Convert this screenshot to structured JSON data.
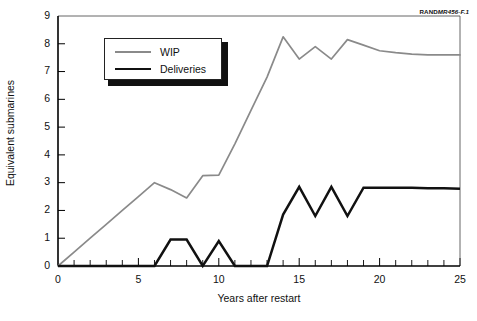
{
  "source_credit": {
    "prefix": "RAND",
    "suffix": "MR456-F.1"
  },
  "legend": {
    "position": "inside-top-left",
    "items": [
      {
        "label": "WIP",
        "color": "#8a8a8a"
      },
      {
        "label": "Deliveries",
        "color": "#111111"
      }
    ]
  },
  "chart_data": {
    "type": "line",
    "title": "",
    "subtitle": "",
    "xlabel": "Years after restart",
    "ylabel": "Equivalent submarines",
    "xlim": [
      0,
      25
    ],
    "ylim": [
      0,
      9
    ],
    "xticks": [
      0,
      5,
      10,
      15,
      20,
      25
    ],
    "xtick_labels": [
      "0",
      "5",
      "10",
      "15",
      "20",
      "25"
    ],
    "xticks_minor_step": 1,
    "yticks": [
      0,
      1,
      2,
      3,
      4,
      5,
      6,
      7,
      8,
      9
    ],
    "ytick_labels": [
      "0",
      "1",
      "2",
      "3",
      "4",
      "5",
      "6",
      "7",
      "8",
      "9"
    ],
    "grid": false,
    "legend_entries": [
      "WIP",
      "Deliveries"
    ],
    "x": [
      0,
      1,
      2,
      3,
      4,
      5,
      6,
      7,
      8,
      9,
      10,
      11,
      12,
      13,
      14,
      15,
      16,
      17,
      18,
      19,
      20,
      21,
      22,
      23,
      24,
      25
    ],
    "series": [
      {
        "name": "WIP",
        "color": "#8a8a8a",
        "values": [
          0.0,
          0.5,
          1.0,
          1.5,
          2.0,
          2.5,
          3.0,
          2.75,
          2.45,
          3.25,
          3.27,
          4.4,
          5.6,
          6.8,
          8.25,
          7.45,
          7.9,
          7.45,
          8.15,
          7.95,
          7.75,
          7.68,
          7.63,
          7.6,
          7.6,
          7.6
        ]
      },
      {
        "name": "Deliveries",
        "color": "#111111",
        "values": [
          0.0,
          0.0,
          0.0,
          0.0,
          0.0,
          0.0,
          0.0,
          0.95,
          0.95,
          0.0,
          0.9,
          0.0,
          0.0,
          0.0,
          1.85,
          2.85,
          1.8,
          2.85,
          1.8,
          2.82,
          2.82,
          2.82,
          2.82,
          2.8,
          2.8,
          2.78
        ]
      }
    ],
    "annotations": []
  }
}
